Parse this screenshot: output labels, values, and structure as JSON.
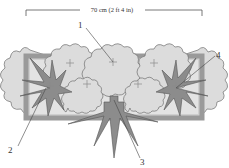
{
  "diagram": {
    "type": "planting-plan",
    "dimension": {
      "label": "70 cm (2 ft 4 in)"
    },
    "callouts": [
      {
        "id": "1",
        "label": "1"
      },
      {
        "id": "2",
        "label": "2"
      },
      {
        "id": "3",
        "label": "3"
      },
      {
        "id": "4",
        "label": "4"
      }
    ],
    "colors": {
      "container_border": "#9a9a9a",
      "container_fill": "#cfcfcf",
      "ruffled_plant": "#dcdcdc",
      "ruffled_outline": "#6e6e6e",
      "spiky_plant": "#8c8c8c",
      "spiky_outline": "#555555",
      "marker": "#8a8a8a",
      "leader": "#444444"
    }
  }
}
